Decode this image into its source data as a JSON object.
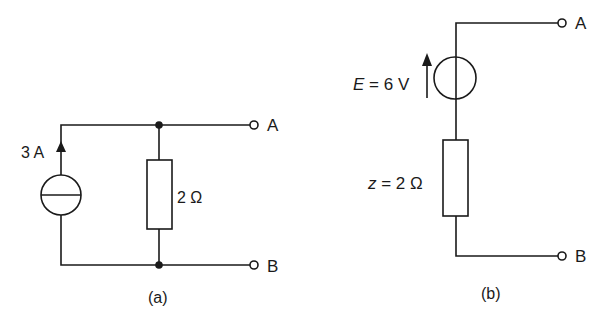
{
  "figure": {
    "type": "circuit-diagram"
  },
  "circuit_a": {
    "caption": "(a)",
    "source": {
      "kind": "current-source",
      "label": "3 A",
      "direction": "up"
    },
    "resistor": {
      "label": "2 Ω"
    },
    "terminals": {
      "top": "A",
      "bottom": "B"
    }
  },
  "circuit_b": {
    "caption": "(b)",
    "source": {
      "kind": "voltage-source",
      "label_var": "E",
      "label_eq": " = 6 V",
      "direction": "up"
    },
    "resistor": {
      "label_var": "z",
      "label_eq": " = 2 Ω"
    },
    "terminals": {
      "top": "A",
      "bottom": "B"
    }
  },
  "colors": {
    "line": "#1a1a1a",
    "background": "#ffffff"
  }
}
